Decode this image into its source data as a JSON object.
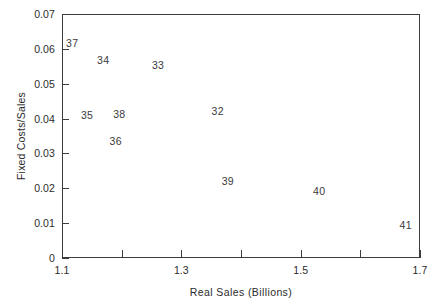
{
  "chart_data": {
    "type": "scatter",
    "title": "",
    "xlabel": "Real Sales (Billions)",
    "ylabel": "Fixed Costs/Sales",
    "xlim": [
      1.1,
      1.7
    ],
    "ylim": [
      0,
      0.07
    ],
    "grid": false,
    "legend": null,
    "marker_style": "text-label-only",
    "xticks": [
      1.1,
      1.2,
      1.3,
      1.4,
      1.5,
      1.6,
      1.7
    ],
    "xtick_labels": [
      "1.1",
      "",
      "1.3",
      "",
      "1.5",
      "",
      "1.7"
    ],
    "yticks": [
      0,
      0.01,
      0.02,
      0.03,
      0.04,
      0.05,
      0.06,
      0.07
    ],
    "ytick_labels": [
      "0",
      "0.01",
      "0.02",
      "0.03",
      "0.04",
      "0.05",
      "0.06",
      "0.07"
    ],
    "points": [
      {
        "label": "37",
        "x": 1.117,
        "y": 0.0617
      },
      {
        "label": "34",
        "x": 1.169,
        "y": 0.0568
      },
      {
        "label": "33",
        "x": 1.261,
        "y": 0.0554
      },
      {
        "label": "32",
        "x": 1.361,
        "y": 0.0422
      },
      {
        "label": "38",
        "x": 1.196,
        "y": 0.0413
      },
      {
        "label": "35",
        "x": 1.142,
        "y": 0.041
      },
      {
        "label": "36",
        "x": 1.19,
        "y": 0.0336
      },
      {
        "label": "39",
        "x": 1.378,
        "y": 0.0221
      },
      {
        "label": "40",
        "x": 1.531,
        "y": 0.0192
      },
      {
        "label": "41",
        "x": 1.676,
        "y": 0.0095
      }
    ]
  },
  "style": {
    "axis_color": "#3c3c3c",
    "text_color": "#2b2b2b",
    "point_label_color": "#3a3a3a",
    "background": "#ffffff"
  }
}
